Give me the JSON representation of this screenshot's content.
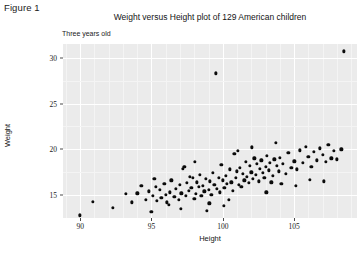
{
  "figure": {
    "label": "Figure 1",
    "title": "Weight versus Height plot of 129 American children",
    "subtitle": "Three years old"
  },
  "chart_data": {
    "type": "scatter",
    "title": "Weight versus Height plot of 129 American children",
    "subtitle": "Three years old",
    "xlabel": "Height",
    "ylabel": "Weight",
    "xlim": [
      88.8,
      109.4
    ],
    "ylim": [
      12.5,
      31.5
    ],
    "xticks": [
      90,
      95,
      100,
      105
    ],
    "yticks": [
      15,
      20,
      25,
      30
    ],
    "grid": true,
    "grid_color": "#ffffff",
    "panel_color": "#ebebeb",
    "point_color": "#0b0b0b",
    "legend": null,
    "n_points": 129,
    "points": [
      [
        90.0,
        12.8
      ],
      [
        90.9,
        14.3
      ],
      [
        92.3,
        13.6
      ],
      [
        93.2,
        15.1
      ],
      [
        93.6,
        14.2
      ],
      [
        94.0,
        15.2
      ],
      [
        94.3,
        16.0
      ],
      [
        94.6,
        14.5
      ],
      [
        94.8,
        15.4
      ],
      [
        95.0,
        13.2
      ],
      [
        95.1,
        14.9
      ],
      [
        95.3,
        15.9
      ],
      [
        95.4,
        14.4
      ],
      [
        95.6,
        15.6
      ],
      [
        95.7,
        14.7
      ],
      [
        95.9,
        16.2
      ],
      [
        96.0,
        15.0
      ],
      [
        96.1,
        14.2
      ],
      [
        96.3,
        15.3
      ],
      [
        96.4,
        16.6
      ],
      [
        96.6,
        14.8
      ],
      [
        96.7,
        15.7
      ],
      [
        96.9,
        14.5
      ],
      [
        97.0,
        16.1
      ],
      [
        97.1,
        15.2
      ],
      [
        97.2,
        17.9
      ],
      [
        97.3,
        18.1
      ],
      [
        97.4,
        14.9
      ],
      [
        97.5,
        16.3
      ],
      [
        97.6,
        15.5
      ],
      [
        97.7,
        17.0
      ],
      [
        97.8,
        15.8
      ],
      [
        97.9,
        16.9
      ],
      [
        98.0,
        14.6
      ],
      [
        98.1,
        15.1
      ],
      [
        98.2,
        16.4
      ],
      [
        98.3,
        15.9
      ],
      [
        98.4,
        17.2
      ],
      [
        98.5,
        14.9
      ],
      [
        98.6,
        16.0
      ],
      [
        98.7,
        15.4
      ],
      [
        98.8,
        16.8
      ],
      [
        98.9,
        13.3
      ],
      [
        99.0,
        15.6
      ],
      [
        99.1,
        16.5
      ],
      [
        99.2,
        15.0
      ],
      [
        99.3,
        17.4
      ],
      [
        99.4,
        16.1
      ],
      [
        99.5,
        28.3
      ],
      [
        99.6,
        15.7
      ],
      [
        99.7,
        16.9
      ],
      [
        99.8,
        15.3
      ],
      [
        99.9,
        18.3
      ],
      [
        100.0,
        16.6
      ],
      [
        100.1,
        15.8
      ],
      [
        100.2,
        17.1
      ],
      [
        100.3,
        16.2
      ],
      [
        100.4,
        14.5
      ],
      [
        100.5,
        17.8
      ],
      [
        100.6,
        16.4
      ],
      [
        100.7,
        15.5
      ],
      [
        100.8,
        19.5
      ],
      [
        100.9,
        16.9
      ],
      [
        101.0,
        17.6
      ],
      [
        101.1,
        16.1
      ],
      [
        101.2,
        18.0
      ],
      [
        101.3,
        15.9
      ],
      [
        101.4,
        17.3
      ],
      [
        101.5,
        16.6
      ],
      [
        101.6,
        18.6
      ],
      [
        101.7,
        17.0
      ],
      [
        101.8,
        16.3
      ],
      [
        101.9,
        18.2
      ],
      [
        102.0,
        17.5
      ],
      [
        102.1,
        16.8
      ],
      [
        102.2,
        19.0
      ],
      [
        102.3,
        17.2
      ],
      [
        102.4,
        18.4
      ],
      [
        102.5,
        16.5
      ],
      [
        102.6,
        17.9
      ],
      [
        102.7,
        18.8
      ],
      [
        102.8,
        17.4
      ],
      [
        102.9,
        16.9
      ],
      [
        103.0,
        18.1
      ],
      [
        103.1,
        19.3
      ],
      [
        103.2,
        17.7
      ],
      [
        103.3,
        18.5
      ],
      [
        103.4,
        16.4
      ],
      [
        103.5,
        17.1
      ],
      [
        103.6,
        18.9
      ],
      [
        103.7,
        20.7
      ],
      [
        103.8,
        18.2
      ],
      [
        103.9,
        17.6
      ],
      [
        104.0,
        19.1
      ],
      [
        104.2,
        18.4
      ],
      [
        104.4,
        17.3
      ],
      [
        104.6,
        19.6
      ],
      [
        104.8,
        18.0
      ],
      [
        105.0,
        18.7
      ],
      [
        105.2,
        17.8
      ],
      [
        105.4,
        19.9
      ],
      [
        105.6,
        18.5
      ],
      [
        105.8,
        20.3
      ],
      [
        106.0,
        19.2
      ],
      [
        106.2,
        18.1
      ],
      [
        106.4,
        19.7
      ],
      [
        106.6,
        18.8
      ],
      [
        106.8,
        20.1
      ],
      [
        107.0,
        19.4
      ],
      [
        107.2,
        18.6
      ],
      [
        107.4,
        20.5
      ],
      [
        107.6,
        19.0
      ],
      [
        107.8,
        19.8
      ],
      [
        108.0,
        18.9
      ],
      [
        108.3,
        20.0
      ],
      [
        108.5,
        30.7
      ],
      [
        96.2,
        13.9
      ],
      [
        97.05,
        13.5
      ],
      [
        99.05,
        14.1
      ],
      [
        100.05,
        13.8
      ],
      [
        101.05,
        19.8
      ],
      [
        102.05,
        20.2
      ],
      [
        103.05,
        15.3
      ],
      [
        104.1,
        16.2
      ],
      [
        105.1,
        16.0
      ],
      [
        106.1,
        16.7
      ],
      [
        107.1,
        16.5
      ],
      [
        95.2,
        16.8
      ],
      [
        98.05,
        18.6
      ]
    ]
  }
}
